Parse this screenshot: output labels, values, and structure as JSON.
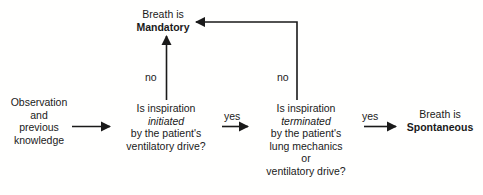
{
  "diagram": {
    "background_color": "#ffffff",
    "line_color": "#1a1a1a",
    "text_color": "#1a1a1a",
    "nodes": {
      "observation": {
        "name": "observation-and-previous-knowledge",
        "lines": [
          "Observation",
          "and",
          "previous",
          "knowledge"
        ]
      },
      "decision_1": {
        "name": "is-inspiration-initiated",
        "lines": [
          "Is inspiration",
          "initiated",
          "by the patient's",
          "ventilatory drive?"
        ],
        "emphasis_line": "initiated"
      },
      "decision_2": {
        "name": "is-inspiration-terminated",
        "lines": [
          "Is inspiration",
          "terminated",
          "by the patient's",
          "lung mechanics",
          "or",
          "ventilatory drive?"
        ],
        "emphasis_line": "terminated"
      },
      "mandatory": {
        "name": "breath-is-mandatory",
        "lines": [
          "Breath is",
          "Mandatory"
        ],
        "bold_line": "Mandatory"
      },
      "spontaneous": {
        "name": "breath-is-spontaneous",
        "lines": [
          "Breath is",
          "Spontaneous"
        ],
        "bold_line": "Spontaneous"
      }
    },
    "edge_labels": {
      "no_1": "no",
      "no_2": "no",
      "yes_1": "yes",
      "yes_2": "yes"
    }
  }
}
